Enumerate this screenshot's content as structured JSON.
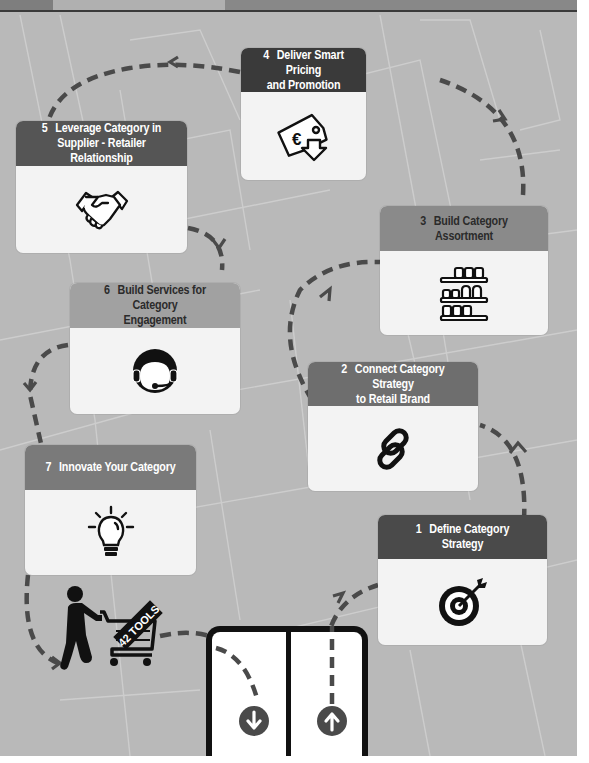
{
  "colors": {
    "background": "#b9b9b9",
    "dashed_path": "#4a4a4a",
    "card_body": "#f3f3f3",
    "header_dark": "#3a3a3a",
    "header_mid": "#5b5b5b",
    "header_light": "#8a8a8a",
    "icon": "#111111"
  },
  "steps": [
    {
      "number": "1",
      "title": "Define Category Strategy",
      "icon": "target-icon"
    },
    {
      "number": "2",
      "title": "Connect Category Strategy to Retail Brand",
      "line1": "Connect Category Strategy",
      "line2": "to Retail Brand",
      "icon": "chain-link-icon"
    },
    {
      "number": "3",
      "title": "Build Category Assortment",
      "icon": "shelves-icon"
    },
    {
      "number": "4",
      "title": "Deliver Smart Pricing and Promotion",
      "line1": "Deliver Smart Pricing",
      "line2": "and Promotion",
      "icon": "euro-price-tag-icon"
    },
    {
      "number": "5",
      "title": "Leverage Category in Supplier - Retailer Relationship",
      "line1": "Leverage Category in",
      "line2": "Supplier - Retailer Relationship",
      "icon": "handshake-icon"
    },
    {
      "number": "6",
      "title": "Build Services for Category Engagement",
      "line1": "Build Services for Category",
      "line2": "Engagement",
      "icon": "headset-icon"
    },
    {
      "number": "7",
      "title": "Innovate Your Category",
      "icon": "lightbulb-icon"
    }
  ],
  "shopper": {
    "cart_label": "42 TOOLS",
    "icon": "shopper-cart-icon"
  },
  "store_door": {
    "enter_icon": "arrow-down-circle-icon",
    "exit_icon": "arrow-up-circle-icon"
  }
}
